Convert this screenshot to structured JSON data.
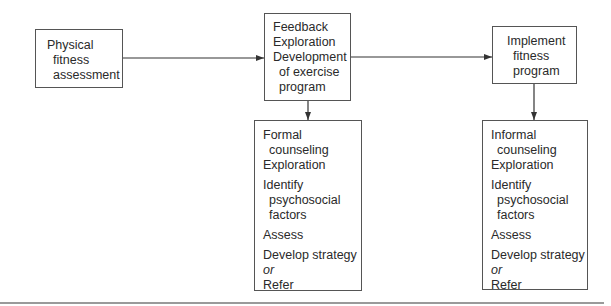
{
  "diagram": {
    "nodes": {
      "assessment": {
        "lines": [
          "Physical",
          "fitness",
          "assessment"
        ]
      },
      "feedback": {
        "lines": [
          "Feedback",
          "Exploration",
          "Development",
          "of exercise",
          "program"
        ]
      },
      "implement": {
        "lines": [
          "Implement",
          "fitness",
          "program"
        ]
      },
      "formal": {
        "lines": [
          "Formal",
          "counseling",
          "Exploration",
          "Identify",
          "psychosocial",
          "factors",
          "Assess",
          "Develop strategy",
          "or",
          "Refer"
        ]
      },
      "informal": {
        "lines": [
          "Informal",
          "counseling",
          "Exploration",
          "Identify",
          "psychosocial",
          "factors",
          "Assess",
          "Develop strategy",
          "or",
          "Refer"
        ]
      }
    },
    "edges": [
      {
        "from": "assessment",
        "to": "feedback"
      },
      {
        "from": "feedback",
        "to": "implement"
      },
      {
        "from": "feedback",
        "to": "formal"
      },
      {
        "from": "implement",
        "to": "informal"
      }
    ],
    "colors": {
      "stroke": "#333333",
      "text": "#2a2a2a",
      "rule": "#9a9a9a"
    }
  }
}
